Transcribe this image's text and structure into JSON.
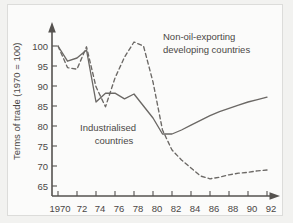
{
  "chart_data": {
    "type": "line",
    "title": "",
    "xlabel": "",
    "ylabel": "Terms of trade (1970 = 100)",
    "xlim": [
      1970,
      1992.6
    ],
    "ylim": [
      63,
      103
    ],
    "grid": false,
    "legend_position": "inline-annotations",
    "x_tick_labels": [
      "1970",
      "72",
      "74",
      "76",
      "78",
      "80",
      "82",
      "84",
      "86",
      "88",
      "90",
      "92"
    ],
    "x_ticks": [
      1970,
      1972,
      1974,
      1976,
      1978,
      1980,
      1982,
      1984,
      1986,
      1988,
      1990,
      1992
    ],
    "y_tick_labels": [
      "65",
      "70",
      "75",
      "80",
      "85",
      "90",
      "95",
      "100"
    ],
    "y_ticks": [
      65,
      70,
      75,
      80,
      85,
      90,
      95,
      100
    ],
    "x": [
      1970,
      1971,
      1972,
      1973,
      1974,
      1975,
      1976,
      1977,
      1978,
      1979,
      1980,
      1981,
      1982,
      1983,
      1984,
      1985,
      1986,
      1987,
      1988,
      1989,
      1990,
      1991,
      1992
    ],
    "series": [
      {
        "name": "Industrialised countries",
        "style": "solid",
        "color": "#6b6865",
        "values": [
          100.0,
          96.2,
          97.0,
          99.0,
          86.0,
          88.2,
          88.2,
          86.8,
          88.0,
          85.0,
          82.0,
          78.0,
          78.0,
          79.0,
          80.2,
          81.4,
          82.6,
          83.6,
          84.4,
          85.2,
          86.0,
          86.6,
          87.2
        ]
      },
      {
        "name": "Non-oil-exporting developing countries",
        "style": "dashed",
        "color": "#6b6865",
        "values": [
          100.0,
          94.6,
          94.2,
          99.8,
          89.8,
          84.8,
          92.0,
          97.2,
          101.0,
          100.0,
          91.0,
          79.0,
          74.0,
          71.5,
          69.5,
          67.5,
          66.8,
          67.2,
          67.8,
          68.2,
          68.4,
          68.8,
          69.0
        ]
      }
    ],
    "annotations": [
      {
        "name": "non-oil-exporting-label",
        "lines": [
          "Non-oil-exporting",
          "developing countries"
        ],
        "x": 1981.2,
        "y": 98.5
      },
      {
        "name": "industrialised-label",
        "lines": [
          "Industrialised",
          "countries"
        ],
        "x": 1977.0,
        "y": 79.6
      }
    ]
  }
}
